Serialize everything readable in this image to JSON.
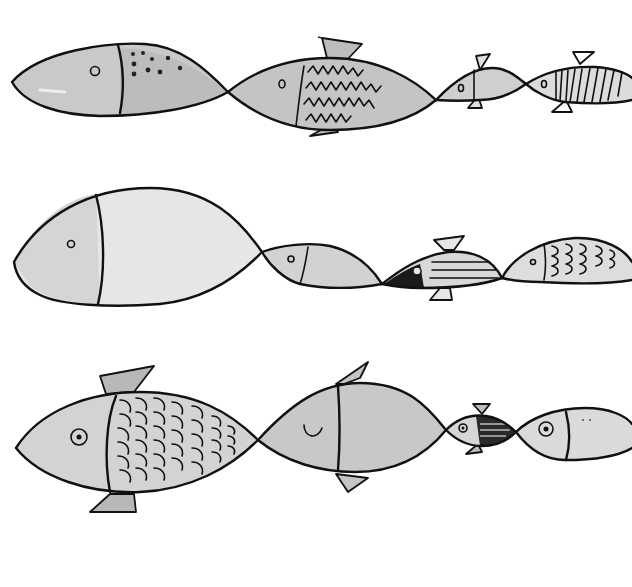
{
  "illustration": {
    "title": "",
    "background": "#ffffff",
    "ink_color": "#111111",
    "wash_colors": {
      "dark": "#b9b9b9",
      "mid": "#cdcdcd",
      "light": "#e2e2e2",
      "fin": "#bdbdbd"
    },
    "rows": [
      {
        "name": "row-1",
        "fish": [
          {
            "name": "large-spotted-fish",
            "pattern": "spots"
          },
          {
            "name": "scaled-fish-with-fins",
            "pattern": "zigzag-scales"
          },
          {
            "name": "small-finned-fish",
            "pattern": "plain"
          },
          {
            "name": "striped-fish",
            "pattern": "vertical-stripes"
          }
        ]
      },
      {
        "name": "row-2",
        "fish": [
          {
            "name": "big-pale-fish",
            "pattern": "plain"
          },
          {
            "name": "medium-fish",
            "pattern": "plain"
          },
          {
            "name": "dark-head-striped-fish",
            "pattern": "horizontal-stripes"
          },
          {
            "name": "wave-scale-fish",
            "pattern": "wave-scales"
          }
        ]
      },
      {
        "name": "row-3",
        "fish": [
          {
            "name": "scalloped-scale-fish",
            "pattern": "scallops"
          },
          {
            "name": "smiling-fish",
            "pattern": "plain"
          },
          {
            "name": "tiny-hatched-fish",
            "pattern": "hatching"
          },
          {
            "name": "tail-end-fish",
            "pattern": "plain"
          }
        ]
      }
    ]
  }
}
